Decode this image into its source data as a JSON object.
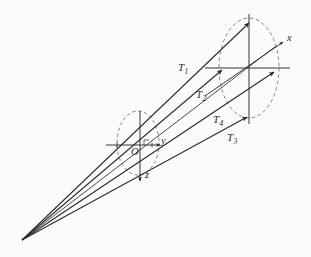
{
  "figure": {
    "kind": "perspective-ray-diagram",
    "background_color": "#fbfbfb",
    "stroke_color": "#2a2a2a",
    "dash_color": "#6e6e6e",
    "width": 311,
    "height": 257
  },
  "axes": {
    "left_frame": {
      "origin_label": "O",
      "y_axis_label": "y",
      "z_axis_label": "z"
    },
    "right_frame": {
      "x_axis_label": "x"
    }
  },
  "rays": [
    {
      "id": "T1",
      "label": "T",
      "sub": "1"
    },
    {
      "id": "T2",
      "label": "T",
      "sub": "2"
    },
    {
      "id": "T4",
      "label": "T",
      "sub": "4"
    },
    {
      "id": "T3",
      "label": "T",
      "sub": "3"
    }
  ],
  "chart_data": {
    "type": "scatter",
    "title": "",
    "xlabel": "",
    "ylabel": "",
    "vanishing_point": [
      22,
      240
    ],
    "left_frame_origin": [
      140,
      145
    ],
    "right_frame_origin": [
      248,
      68
    ],
    "left_ellipse": {
      "cx": 138,
      "cy": 143,
      "rx": 21,
      "ry": 32,
      "dashed": true
    },
    "right_ellipse": {
      "cx": 249,
      "cy": 68,
      "rx": 30,
      "ry": 50,
      "dashed": true
    },
    "ray_endpoints": [
      {
        "id": "T1",
        "x": 249,
        "y": 23,
        "label_x": 178,
        "label_y": 62
      },
      {
        "id": "T2",
        "x": 222,
        "y": 70,
        "label_x": 196,
        "label_y": 89
      },
      {
        "id": "T4",
        "x": 247,
        "y": 117,
        "label_x": 213,
        "label_y": 114
      },
      {
        "id": "T3",
        "x": 274,
        "y": 72,
        "label_x": 227,
        "label_y": 132
      }
    ],
    "grid": false,
    "legend": "none"
  }
}
